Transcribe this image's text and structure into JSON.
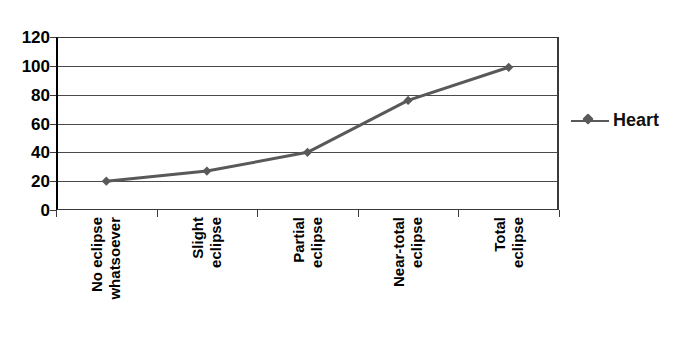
{
  "chart_data": {
    "type": "line",
    "title": "",
    "xlabel": "",
    "ylabel": "",
    "ylim": [
      0,
      120
    ],
    "yticks": [
      0,
      20,
      40,
      60,
      80,
      100,
      120
    ],
    "ytick_labels": [
      "0",
      "20",
      "40",
      "60",
      "80",
      "100",
      "120"
    ],
    "grid": true,
    "legend_position": "right",
    "categories": [
      "No eclipse whatsoever",
      "Slight eclipse",
      "Partial eclipse",
      "Near-total eclipse",
      "Total eclipse"
    ],
    "category_lines": [
      [
        "No eclipse",
        "whatsoever"
      ],
      [
        "Slight",
        "eclipse"
      ],
      [
        "Partial",
        "eclipse"
      ],
      [
        "Near-total",
        "eclipse"
      ],
      [
        "Total",
        "eclipse"
      ]
    ],
    "series": [
      {
        "name": "Heart",
        "values": [
          20,
          27,
          40,
          76,
          99
        ],
        "color": "#595959",
        "marker": "diamond"
      }
    ]
  },
  "legend": {
    "entries": [
      {
        "label": "Heart",
        "color": "#595959",
        "marker": "diamond-icon"
      }
    ]
  },
  "colors": {
    "series": "#595959",
    "axis": "#3a3a3a",
    "gridline": "#4a4a4a",
    "text": "#000000",
    "background": "#ffffff"
  }
}
